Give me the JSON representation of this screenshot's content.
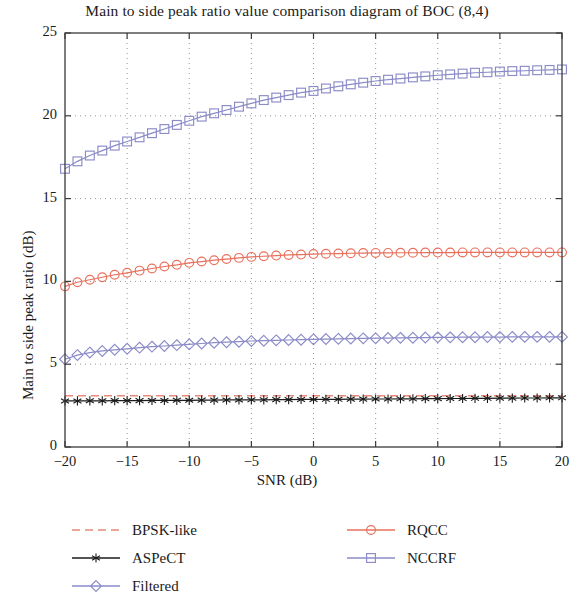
{
  "chart_data": {
    "type": "line",
    "title": "Main to side peak ratio value comparison diagram of BOC (8,4)",
    "xlabel": "SNR (dB)",
    "ylabel": "Main to side peak ratio (dB)",
    "xlim": [
      -20,
      20
    ],
    "ylim": [
      0,
      25
    ],
    "xticks": [
      -20,
      -15,
      -10,
      -5,
      0,
      5,
      10,
      15,
      20
    ],
    "xtick_labels": [
      "−20",
      "−15",
      "−10",
      "−5",
      "0",
      "5",
      "10",
      "15",
      "20"
    ],
    "yticks": [
      0,
      5,
      10,
      15,
      20,
      25
    ],
    "ytick_labels": [
      "0",
      "5",
      "10",
      "15",
      "20",
      "25"
    ],
    "grid": "dotted",
    "legend_position": "below-axes-two-columns",
    "x": [
      -20,
      -19,
      -18,
      -17,
      -16,
      -15,
      -14,
      -13,
      -12,
      -11,
      -10,
      -9,
      -8,
      -7,
      -6,
      -5,
      -4,
      -3,
      -2,
      -1,
      0,
      1,
      2,
      3,
      4,
      5,
      6,
      7,
      8,
      9,
      10,
      11,
      12,
      13,
      14,
      15,
      16,
      17,
      18,
      19,
      20
    ],
    "series": [
      {
        "name": "BPSK-like",
        "color": "#e8897a",
        "marker": "none",
        "linestyle": "dashed",
        "values": [
          3.1,
          3.1,
          3.1,
          3.1,
          3.1,
          3.1,
          3.1,
          3.1,
          3.1,
          3.1,
          3.1,
          3.1,
          3.1,
          3.1,
          3.1,
          3.1,
          3.1,
          3.1,
          3.1,
          3.1,
          3.1,
          3.1,
          3.1,
          3.1,
          3.1,
          3.1,
          3.1,
          3.1,
          3.1,
          3.1,
          3.1,
          3.1,
          3.1,
          3.1,
          3.1,
          3.1,
          3.1,
          3.1,
          3.1,
          3.1,
          3.1
        ]
      },
      {
        "name": "ASPeCT",
        "color": "#1b1b1b",
        "marker": "star",
        "linestyle": "solid",
        "values": [
          2.78,
          2.78,
          2.79,
          2.79,
          2.8,
          2.8,
          2.8,
          2.81,
          2.81,
          2.82,
          2.82,
          2.83,
          2.83,
          2.84,
          2.84,
          2.85,
          2.85,
          2.86,
          2.86,
          2.87,
          2.87,
          2.88,
          2.88,
          2.89,
          2.89,
          2.9,
          2.9,
          2.91,
          2.91,
          2.92,
          2.92,
          2.93,
          2.93,
          2.94,
          2.94,
          2.95,
          2.95,
          2.96,
          2.96,
          2.97,
          2.97
        ]
      },
      {
        "name": "Filtered",
        "color": "#8b8bc8",
        "marker": "diamond",
        "linestyle": "solid",
        "values": [
          5.3,
          5.55,
          5.7,
          5.8,
          5.87,
          5.93,
          6.0,
          6.06,
          6.1,
          6.15,
          6.2,
          6.25,
          6.3,
          6.33,
          6.36,
          6.4,
          6.42,
          6.44,
          6.46,
          6.48,
          6.5,
          6.52,
          6.53,
          6.55,
          6.56,
          6.57,
          6.58,
          6.59,
          6.6,
          6.61,
          6.62,
          6.62,
          6.63,
          6.63,
          6.64,
          6.64,
          6.65,
          6.65,
          6.65,
          6.65,
          6.65
        ]
      },
      {
        "name": "RQCC",
        "color": "#e8705c",
        "marker": "circle",
        "linestyle": "solid",
        "values": [
          9.7,
          9.95,
          10.1,
          10.25,
          10.4,
          10.52,
          10.65,
          10.78,
          10.9,
          11.0,
          11.12,
          11.2,
          11.28,
          11.35,
          11.42,
          11.48,
          11.52,
          11.56,
          11.6,
          11.62,
          11.65,
          11.67,
          11.68,
          11.7,
          11.71,
          11.72,
          11.72,
          11.73,
          11.73,
          11.74,
          11.74,
          11.74,
          11.75,
          11.75,
          11.75,
          11.75,
          11.75,
          11.75,
          11.75,
          11.75,
          11.75
        ]
      },
      {
        "name": "NCCRF",
        "color": "#8b8bc8",
        "marker": "square",
        "linestyle": "solid",
        "values": [
          16.8,
          17.25,
          17.6,
          17.9,
          18.2,
          18.45,
          18.7,
          18.95,
          19.2,
          19.45,
          19.7,
          19.95,
          20.15,
          20.35,
          20.55,
          20.75,
          20.95,
          21.1,
          21.25,
          21.4,
          21.5,
          21.65,
          21.78,
          21.9,
          22.0,
          22.1,
          22.18,
          22.25,
          22.32,
          22.38,
          22.45,
          22.5,
          22.55,
          22.6,
          22.63,
          22.67,
          22.7,
          22.72,
          22.75,
          22.77,
          22.8
        ]
      }
    ]
  },
  "legend": {
    "columns": [
      [
        {
          "label": "BPSK-like",
          "color": "#e8897a",
          "marker": "none",
          "linestyle": "dashed"
        },
        {
          "label": "ASPeCT",
          "color": "#1b1b1b",
          "marker": "star",
          "linestyle": "solid"
        },
        {
          "label": "Filtered",
          "color": "#8b8bc8",
          "marker": "diamond",
          "linestyle": "solid"
        }
      ],
      [
        {
          "label": "RQCC",
          "color": "#e8705c",
          "marker": "circle",
          "linestyle": "solid"
        },
        {
          "label": "NCCRF",
          "color": "#8b8bc8",
          "marker": "square",
          "linestyle": "solid"
        }
      ]
    ]
  },
  "axes_style": {
    "frame_color": "#3a3a3a",
    "grid_color": "#8a8a8a",
    "background": "#ffffff"
  }
}
